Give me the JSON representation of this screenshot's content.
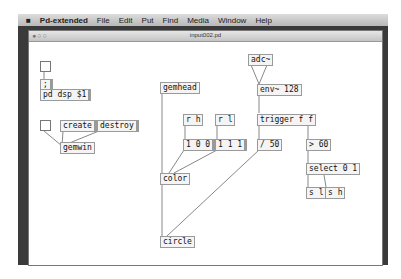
{
  "menubar": {
    "apple": "",
    "app_name": "Pd-extended",
    "items": [
      "File",
      "Edit",
      "Put",
      "Find",
      "Media",
      "Window",
      "Help"
    ]
  },
  "window": {
    "title": "input002.pd",
    "traffic_lights": "●○○"
  },
  "patch": {
    "objects": {
      "dsp_msg_1": ";",
      "dsp_msg_2": "pd dsp $1",
      "create": "create",
      "destroy": "destroy",
      "gemwin": "gemwin",
      "gemhead": "gemhead",
      "r_h": "r h",
      "r_l": "r l",
      "msg_100": "1 0 0",
      "msg_111": "1 1 1",
      "color": "color",
      "circle": "circle",
      "adc": "adc~",
      "env": "env~ 128",
      "trigger": "trigger f f",
      "div": "/ 50",
      "gt": "> 60",
      "select": "select 0 1",
      "s_l": "s l",
      "s_h": "s h"
    }
  }
}
